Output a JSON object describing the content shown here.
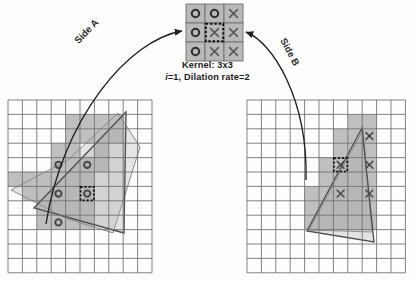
{
  "figure": {
    "type": "diagram"
  },
  "kernel": {
    "caption_line1": "Kernel: 3x3",
    "caption_line2_italic": "i",
    "caption_line2_rest": "=1, Dilation rate=2",
    "size": "3x3",
    "i": 1,
    "dilation_rate": 2,
    "cell_fill": "#b9b9b9",
    "cell_stroke": "#6f6f6f",
    "highlight_border": "#111111",
    "origin": {
      "x": 186,
      "y": 4
    },
    "cell": 19,
    "cells": [
      {
        "row": 0,
        "col": 0,
        "glyph": "circle",
        "highlighted": false
      },
      {
        "row": 0,
        "col": 1,
        "glyph": "circle",
        "highlighted": false
      },
      {
        "row": 0,
        "col": 2,
        "glyph": "cross",
        "highlighted": false
      },
      {
        "row": 1,
        "col": 0,
        "glyph": "circle",
        "highlighted": false
      },
      {
        "row": 1,
        "col": 1,
        "glyph": "cross",
        "highlighted": true
      },
      {
        "row": 1,
        "col": 2,
        "glyph": "cross",
        "highlighted": false
      },
      {
        "row": 2,
        "col": 0,
        "glyph": "circle",
        "highlighted": false
      },
      {
        "row": 2,
        "col": 1,
        "glyph": "cross",
        "highlighted": false
      },
      {
        "row": 2,
        "col": 2,
        "glyph": "cross",
        "highlighted": false
      }
    ]
  },
  "connectors": {
    "side_a": {
      "label": "Side A",
      "path": "M 46,224 C 62,120 128,40 182,31",
      "arrow_at": {
        "x": 184,
        "y": 31
      },
      "color": "#1f1f1f"
    },
    "side_b": {
      "label": "Side B",
      "path": "M 306,180 C 308,98 272,42 246,32",
      "arrow_at": {
        "x": 244,
        "y": 32
      },
      "color": "#1f1f1f"
    }
  },
  "grids": {
    "cell_size": 14.4,
    "grid_line_color": "#6d6d6d",
    "shade_color": "#bfbfbf",
    "shade_color_light": "#cfcfcf",
    "polygon_stroke": "#8a8a8a",
    "marker_color": "#4a4a4a",
    "highlight_border": "#111111",
    "left": {
      "name": "Side A feature map",
      "origin": {
        "x": 8,
        "y": 100
      },
      "cols": 10,
      "rows": 12,
      "shaded_cells": [
        [
          1,
          4
        ],
        [
          1,
          5
        ],
        [
          1,
          6
        ],
        [
          1,
          7
        ],
        [
          2,
          4
        ],
        [
          2,
          5
        ],
        [
          2,
          6
        ],
        [
          2,
          7
        ],
        [
          3,
          3
        ],
        [
          3,
          4
        ],
        [
          3,
          6
        ],
        [
          4,
          3
        ],
        [
          4,
          4
        ],
        [
          4,
          5
        ],
        [
          4,
          6
        ],
        [
          5,
          0
        ],
        [
          5,
          1
        ],
        [
          5,
          2
        ],
        [
          5,
          3
        ],
        [
          5,
          4
        ],
        [
          5,
          5
        ],
        [
          6,
          1
        ],
        [
          6,
          2
        ],
        [
          6,
          3
        ],
        [
          6,
          4
        ],
        [
          6,
          5
        ],
        [
          7,
          2
        ],
        [
          7,
          3
        ],
        [
          7,
          4
        ],
        [
          7,
          5
        ],
        [
          8,
          2
        ],
        [
          8,
          3
        ],
        [
          8,
          4
        ],
        [
          8,
          5
        ]
      ],
      "polygon_points": "11,190 68,160 118,113 140,147 113,233 68,219",
      "polygon_points_2": "34,208 126,112 124,233",
      "markers": [
        {
          "type": "circle",
          "row": 4,
          "col": 3,
          "highlighted": false
        },
        {
          "type": "circle",
          "row": 4,
          "col": 5,
          "highlighted": false
        },
        {
          "type": "circle",
          "row": 6,
          "col": 3,
          "highlighted": false
        },
        {
          "type": "circle",
          "row": 6,
          "col": 5,
          "highlighted": true
        },
        {
          "type": "circle",
          "row": 8,
          "col": 3,
          "highlighted": false
        }
      ]
    },
    "right": {
      "name": "Side B feature map",
      "origin": {
        "x": 247,
        "y": 100
      },
      "cols": 11,
      "rows": 12,
      "shaded_cells": [
        [
          1,
          7
        ],
        [
          1,
          8
        ],
        [
          2,
          6
        ],
        [
          2,
          7
        ],
        [
          2,
          8
        ],
        [
          3,
          6
        ],
        [
          3,
          7
        ],
        [
          3,
          8
        ],
        [
          4,
          5
        ],
        [
          4,
          6
        ],
        [
          4,
          7
        ],
        [
          4,
          8
        ],
        [
          5,
          5
        ],
        [
          5,
          6
        ],
        [
          5,
          7
        ],
        [
          5,
          8
        ],
        [
          6,
          4
        ],
        [
          6,
          5
        ],
        [
          6,
          6
        ],
        [
          6,
          7
        ],
        [
          6,
          8
        ],
        [
          7,
          4
        ],
        [
          7,
          5
        ],
        [
          7,
          6
        ],
        [
          7,
          7
        ],
        [
          7,
          8
        ],
        [
          8,
          4
        ],
        [
          8,
          5
        ],
        [
          8,
          6
        ],
        [
          8,
          7
        ],
        [
          8,
          8
        ]
      ],
      "polygon_points": "363,130 372,232 309,230",
      "polygon_points_2": "362,128 307,231 374,242",
      "markers": [
        {
          "type": "cross",
          "row": 2,
          "col": 8,
          "highlighted": false
        },
        {
          "type": "cross",
          "row": 4,
          "col": 6,
          "highlighted": true
        },
        {
          "type": "cross",
          "row": 4,
          "col": 8,
          "highlighted": false
        },
        {
          "type": "cross",
          "row": 6,
          "col": 6,
          "highlighted": false
        },
        {
          "type": "cross",
          "row": 6,
          "col": 8,
          "highlighted": false
        }
      ]
    }
  }
}
